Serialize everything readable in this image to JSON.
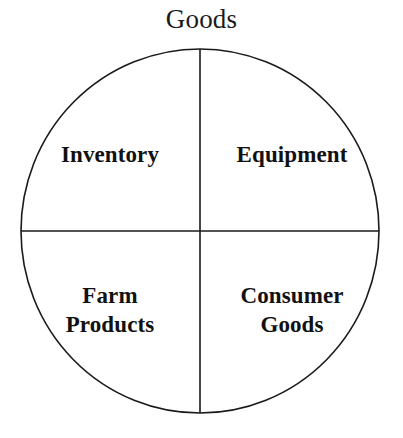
{
  "figure": {
    "title": "Goods",
    "type": "quadrant-circle-diagram",
    "background_color": "#ffffff",
    "stroke_color": "#1a1a1a",
    "text_color": "#111111"
  },
  "circle": {
    "center_x": 200,
    "center_y": 231,
    "radius_x": 179,
    "radius_y": 182,
    "stroke_width": 1.6
  },
  "dividers": {
    "vertical_label": "vertical-divider",
    "horizontal_label": "horizontal-divider",
    "stroke_width": 1.6
  },
  "quadrants": [
    {
      "position": "top-left",
      "label": "Inventory",
      "lines": [
        "Inventory"
      ]
    },
    {
      "position": "top-right",
      "label": "Equipment",
      "lines": [
        "Equipment"
      ]
    },
    {
      "position": "bottom-left",
      "label": "Farm\nProducts",
      "lines": [
        "Farm",
        "Products"
      ]
    },
    {
      "position": "bottom-right",
      "label": "Consumer\nGoods",
      "lines": [
        "Consumer",
        "Goods"
      ]
    }
  ]
}
